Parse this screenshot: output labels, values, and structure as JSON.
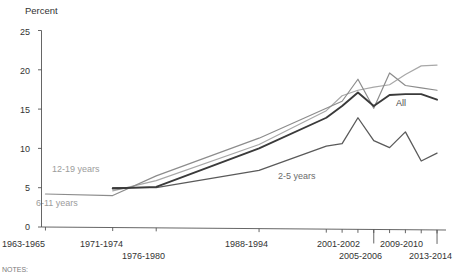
{
  "chart_data": {
    "type": "line",
    "title": "",
    "subtitle": "",
    "xlabel": "",
    "ylabel": "Percent",
    "ylim": [
      0,
      25
    ],
    "ytick_labels": [
      "0",
      "5",
      "10",
      "15",
      "20",
      "25"
    ],
    "ytick_values": [
      0,
      5,
      10,
      15,
      20,
      25
    ],
    "grid": false,
    "legend_position": "inline-labels",
    "x_categories": [
      "1963-1965",
      "1971-1974",
      "1976-1980",
      "1988-1994",
      "1999-2000",
      "2001-2002",
      "2003-2004",
      "2005-2006",
      "2007-2008",
      "2009-2010",
      "2011-2012",
      "2013-2014"
    ],
    "xtick_labels": [
      "1963-1965",
      "1971-1974",
      "1976-1980",
      "1988-1994",
      "2001-2002",
      "2005-2006",
      "2009-2010",
      "2013-2014"
    ],
    "series": [
      {
        "name": "All",
        "color": "#3a3a3a",
        "x": [
          1972.5,
          1978,
          1991,
          1999.5,
          2001.5,
          2003.5,
          2005.5,
          2007.5,
          2009.5,
          2011.5,
          2013.5
        ],
        "values": [
          4.9,
          5.1,
          10.0,
          13.9,
          15.4,
          17.1,
          15.4,
          16.8,
          16.9,
          16.9,
          16.2
        ]
      },
      {
        "name": "2-5 years",
        "color": "#5a5a5a",
        "x": [
          1972.5,
          1978,
          1991,
          1999.5,
          2001.5,
          2003.5,
          2005.5,
          2007.5,
          2009.5,
          2011.5,
          2013.5
        ],
        "values": [
          5.0,
          5.0,
          7.2,
          10.3,
          10.6,
          13.9,
          11.0,
          10.1,
          12.1,
          8.4,
          9.4
        ]
      },
      {
        "name": "6-11 years",
        "color": "#8c8c8c",
        "x": [
          1964,
          1972.5,
          1978,
          1991,
          1999.5,
          2001.5,
          2003.5,
          2005.5,
          2007.5,
          2009.5,
          2011.5,
          2013.5
        ],
        "values": [
          4.2,
          4.0,
          6.5,
          11.3,
          15.1,
          16.0,
          18.8,
          15.1,
          19.6,
          18.0,
          17.7,
          17.4
        ]
      },
      {
        "name": "12-19 years",
        "color": "#a8a8a8",
        "x": [
          1972.5,
          1978,
          1991,
          1999.5,
          2001.5,
          2003.5,
          2005.5,
          2007.5,
          2009.5,
          2011.5,
          2013.5
        ],
        "values": [
          4.6,
          5.9,
          10.5,
          14.8,
          16.7,
          17.4,
          17.8,
          18.1,
          19.4,
          20.5,
          20.6
        ]
      }
    ],
    "annotations": [
      {
        "text": "12-19 years",
        "series": "12-19 years"
      },
      {
        "text": "6-11 years",
        "series": "6-11 years"
      },
      {
        "text": "2-5 years",
        "series": "2-5 years"
      },
      {
        "text": "All",
        "series": "All"
      }
    ]
  },
  "axes": {
    "y_title": "Percent",
    "y_ticks": [
      "25",
      "20",
      "15",
      "10",
      "5",
      "0"
    ],
    "x_ticks_row1": [
      "1963-1965",
      "1971-1974",
      "1988-1994",
      "2001-2002",
      "2009-2010"
    ],
    "x_ticks_row2": [
      "1976-1980",
      "2005-2006",
      "2013-2014"
    ]
  },
  "labels": {
    "series_12_19": "12-19 years",
    "series_6_11": "6-11 years",
    "series_2_5": "2-5 years",
    "series_all": "All"
  },
  "footer": {
    "notes_partial": "NOTES:"
  },
  "colors": {
    "all": "#3a3a3a",
    "age_2_5": "#5a5a5a",
    "age_6_11": "#8c8c8c",
    "age_12_19": "#a8a8a8",
    "axis": "#555555",
    "text": "#333333"
  }
}
